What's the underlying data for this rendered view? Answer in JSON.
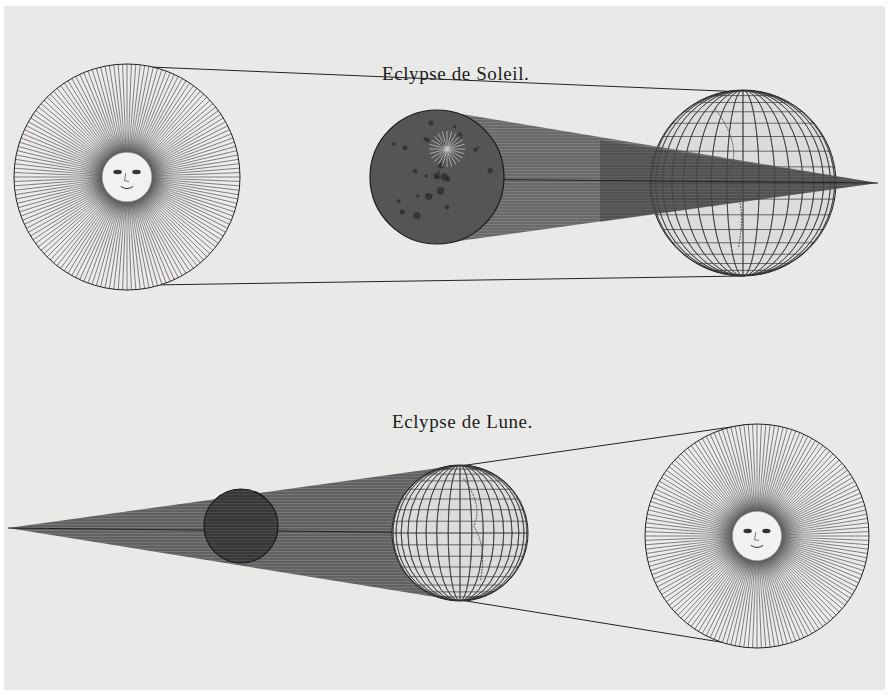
{
  "plate": {
    "paper_color": "#e9e9e7",
    "ink_color": "#1c1c1c"
  },
  "solar_eclipse": {
    "title": "Eclypse de Soleil.",
    "sun": {
      "cx": 127,
      "cy": 177,
      "r": 113,
      "face": true
    },
    "moon": {
      "cx": 437,
      "cy": 177,
      "r": 67
    },
    "earth": {
      "cx": 743,
      "cy": 183,
      "r": 93,
      "hemisphere": "Eastern"
    },
    "umbra_tip": {
      "x": 878,
      "y": 183
    }
  },
  "lunar_eclipse": {
    "title": "Eclypse de Lune.",
    "sun": {
      "cx": 757,
      "cy": 536,
      "r": 112,
      "face": true
    },
    "earth": {
      "cx": 460,
      "cy": 533,
      "r": 68,
      "hemisphere": "Western"
    },
    "moon": {
      "cx": 241,
      "cy": 526,
      "r": 37
    },
    "umbra_tip": {
      "x": 8,
      "y": 528
    }
  }
}
